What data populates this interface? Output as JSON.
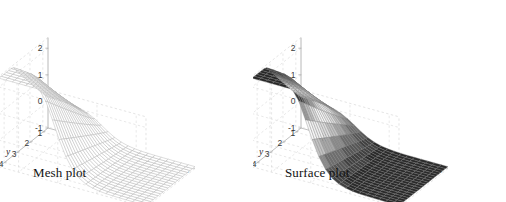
{
  "figure": {
    "width": 506,
    "height": 202,
    "background": "#ffffff",
    "panels": [
      {
        "id": "mesh",
        "caption": "Mesh plot",
        "render": "mesh"
      },
      {
        "id": "surface",
        "caption": "Surface plot",
        "render": "surface"
      }
    ]
  },
  "chart_data": {
    "type": "surface",
    "title": "",
    "subtitle": "",
    "plots": [
      {
        "name": "Mesh plot",
        "render_style": "wireframe",
        "line_color": "#b4b4b4",
        "face_color": "none"
      },
      {
        "name": "Surface plot",
        "render_style": "shaded",
        "line_color": "#7a7a7a",
        "colormap": "gray"
      }
    ],
    "function": "z = tanh(x) * exp(-((y-4)/6)^2) scaled sigmoid ridge",
    "x": {
      "label": "x",
      "min": -3,
      "max": 4.5,
      "ticks": [
        -2,
        0,
        2,
        4
      ],
      "ticklabels": [
        "-2",
        "0",
        "2",
        "4"
      ]
    },
    "y": {
      "label": "y",
      "min": 0.6,
      "max": 4.4,
      "ticks": [
        1,
        2,
        3,
        4
      ],
      "ticklabels": [
        "1",
        "2",
        "3",
        "4"
      ]
    },
    "z": {
      "label": "z",
      "min": -1,
      "max": 2.4,
      "ticks": [
        -1,
        0,
        1,
        2
      ],
      "ticklabels": [
        "-1",
        "0",
        "1",
        "2"
      ]
    },
    "grid": true,
    "grid_style": "dashed",
    "grid_color": "#d8d8d8",
    "axis_color": "#b0b0b0",
    "legend": "none",
    "view": {
      "azimuth": -37.5,
      "elevation": 30
    },
    "mesh_resolution": {
      "nx": 22,
      "ny": 20
    },
    "z_surface_note": "Ridge rising from z=-1 at low x/low y toward z=2.3 at x=-2.5,y=4; flat plateau near z=-0.9 at high x low y",
    "colormap_bands": [
      "#2a2a2a",
      "#414141",
      "#575757",
      "#6e6e6e",
      "#8a8a8a",
      "#a6a6a6",
      "#c2c2c2",
      "#dcdcdc",
      "#eeeeee",
      "#f6f6f6",
      "#dddddd",
      "#bdbdbd",
      "#9a9a9a",
      "#777777",
      "#545454",
      "#3a3a3a",
      "#262626"
    ]
  }
}
